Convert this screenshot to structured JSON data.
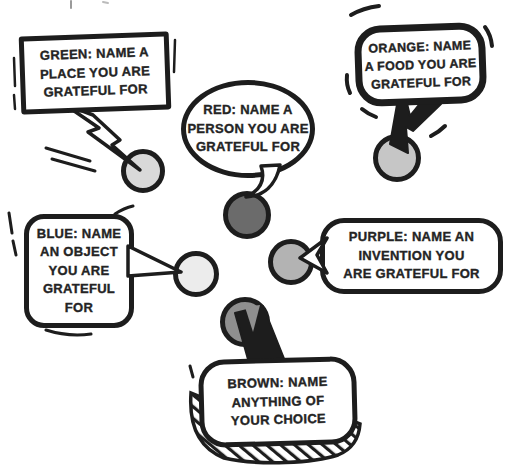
{
  "canvas": {
    "background": "#ffffff",
    "ink": "#1d1d1d",
    "text_color": "#242424"
  },
  "bubbles": {
    "green": {
      "text": "GREEN: NAME A PLACE YOU ARE GRATEFUL FOR",
      "lines": [
        "GREEN: NAME A",
        "PLACE YOU ARE",
        "GRATEFUL FOR"
      ],
      "dot_color": "#d9d9d9",
      "bubble_shape": "rectangle",
      "tail_shape": "lightning-bolt"
    },
    "red": {
      "text": "RED: NAME A PERSON YOU ARE GRATEFUL FOR",
      "lines": [
        "RED: NAME A",
        "PERSON YOU ARE",
        "GRATEFUL FOR"
      ],
      "dot_color": "#6b6b6b",
      "bubble_shape": "ellipse",
      "tail_shape": "curved-hook"
    },
    "orange": {
      "text": "ORANGE: NAME A FOOD YOU ARE GRATEFUL FOR",
      "lines": [
        "ORANGE: NAME",
        "A FOOD YOU ARE",
        "GRATEFUL FOR"
      ],
      "dot_color": "#c6c6c6",
      "bubble_shape": "rounded-square",
      "tail_shape": "black-wedge"
    },
    "blue": {
      "text": "BLUE: NAME AN OBJECT YOU ARE GRATEFUL FOR",
      "lines": [
        "BLUE: NAME",
        "AN OBJECT",
        "YOU ARE",
        "GRATEFUL",
        "FOR"
      ],
      "dot_color": "#ececec",
      "bubble_shape": "rounded-rectangle",
      "tail_shape": "triangle-right"
    },
    "purple": {
      "text": "PURPLE: NAME AN INVENTION YOU ARE GRATEFUL FOR",
      "lines": [
        "PURPLE: NAME AN",
        "INVENTION YOU",
        "ARE GRATEFUL FOR"
      ],
      "dot_color": "#b3b3b3",
      "bubble_shape": "rounded-rectangle",
      "tail_shape": "chevron-left"
    },
    "brown": {
      "text": "BROWN: NAME ANYTHING OF YOUR CHOICE",
      "lines": [
        "BROWN: NAME",
        "ANYTHING OF",
        "YOUR CHOICE"
      ],
      "dot_color": "#8f8f8f",
      "bubble_shape": "rounded-rectangle-hatched-shadow",
      "tail_shape": "black-wedge-up"
    }
  }
}
